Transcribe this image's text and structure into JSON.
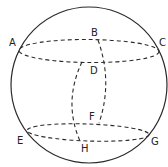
{
  "diagram": {
    "type": "sphere-with-parallel-circles",
    "colors": {
      "background": "#ffffff",
      "stroke": "#2a2a2a",
      "label": "#222222"
    },
    "sphere": {
      "cx": 89,
      "cy": 85,
      "r": 78
    },
    "upper_circle": {
      "cx": 89,
      "cy": 51,
      "rx": 70,
      "ry": 11.5,
      "rotate": 0.5
    },
    "lower_circle": {
      "cx": 88,
      "cy": 132.5,
      "rx": 61,
      "ry": 8.5,
      "rotate": 2
    },
    "meridians": [
      {
        "from": "B",
        "to": "F",
        "path": "M98,40 Q113,82 99,123"
      },
      {
        "from": "D",
        "to": "H",
        "path": "M82,62 Q63,102 80,141"
      }
    ],
    "labels": [
      {
        "id": "A",
        "text": "A",
        "x": 9,
        "y": 46
      },
      {
        "id": "B",
        "text": "B",
        "x": 91,
        "y": 36
      },
      {
        "id": "C",
        "text": "C",
        "x": 159,
        "y": 46
      },
      {
        "id": "D",
        "text": "D",
        "x": 90,
        "y": 74
      },
      {
        "id": "E",
        "text": "E",
        "x": 17,
        "y": 144
      },
      {
        "id": "F",
        "text": "F",
        "x": 89,
        "y": 120
      },
      {
        "id": "G",
        "text": "G",
        "x": 151,
        "y": 145
      },
      {
        "id": "H",
        "text": "H",
        "x": 81,
        "y": 152
      }
    ]
  }
}
